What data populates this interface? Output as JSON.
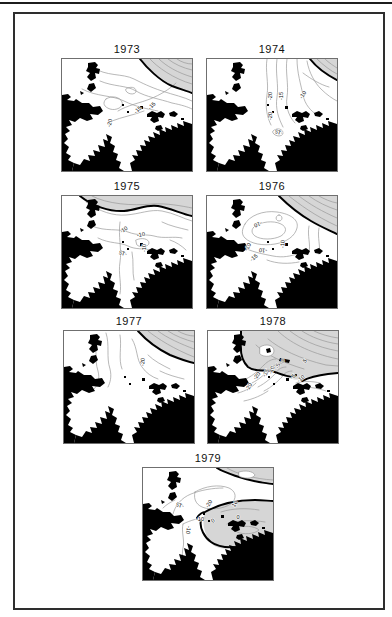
{
  "figure": {
    "colors": {
      "land": "#000000",
      "sea": "#ffffff",
      "shade": "#d6d6d6",
      "contour_thin": "#9a9a9a",
      "contour_thick": "#000000",
      "frame": "#2e2e2e"
    },
    "panels": [
      {
        "year": "1973",
        "contour_labels": [
          {
            "t": "-20",
            "x": 48,
            "y": 64,
            "r": -78
          },
          {
            "t": "-15",
            "x": 76,
            "y": 51,
            "r": -45
          },
          {
            "t": "-15",
            "x": 90,
            "y": 47,
            "r": -45
          }
        ]
      },
      {
        "year": "1974",
        "contour_labels": [
          {
            "t": "-20",
            "x": 64,
            "y": 37,
            "r": -90
          },
          {
            "t": "-15",
            "x": 75,
            "y": 37,
            "r": -90
          },
          {
            "t": "-20",
            "x": 64,
            "y": 57,
            "r": -90
          },
          {
            "t": "-15",
            "x": 72,
            "y": 73,
            "r": 200
          },
          {
            "t": "-10",
            "x": 96,
            "y": 36,
            "r": -55
          }
        ]
      },
      {
        "year": "1975",
        "contour_labels": [
          {
            "t": "-10",
            "x": 62,
            "y": 34,
            "r": -35
          },
          {
            "t": "-10",
            "x": 79,
            "y": 39,
            "r": -10
          },
          {
            "t": "-15",
            "x": 61,
            "y": 57,
            "r": 200
          },
          {
            "t": "-10",
            "x": 83,
            "y": 52,
            "r": -90
          }
        ]
      },
      {
        "year": "1976",
        "contour_labels": [
          {
            "t": "-10",
            "x": 51,
            "y": 28,
            "r": 160
          },
          {
            "t": "-10",
            "x": 41,
            "y": 51,
            "r": -60
          },
          {
            "t": "-10",
            "x": 56,
            "y": 54,
            "r": 185
          },
          {
            "t": "-10",
            "x": 76,
            "y": 48,
            "r": -85
          },
          {
            "t": "-15",
            "x": 47,
            "y": 62,
            "r": -40
          }
        ]
      },
      {
        "year": "1977",
        "contour_labels": [
          {
            "t": "-20",
            "x": 79,
            "y": 31,
            "r": -85
          }
        ]
      },
      {
        "year": "1978",
        "contour_labels": [
          {
            "t": "-20",
            "x": 49,
            "y": 45,
            "r": -50
          },
          {
            "t": "-15",
            "x": 58,
            "y": 42,
            "r": -60
          },
          {
            "t": "-10",
            "x": 64,
            "y": 39,
            "r": -70
          },
          {
            "t": "-5",
            "x": 70,
            "y": 35,
            "r": -70
          },
          {
            "t": "0",
            "x": 75,
            "y": 30,
            "r": -20
          },
          {
            "t": "5",
            "x": 97,
            "y": 30,
            "r": -45
          },
          {
            "t": "-5",
            "x": 85,
            "y": 46,
            "r": -40
          },
          {
            "t": "-10",
            "x": 93,
            "y": 48,
            "r": -40
          },
          {
            "t": "-20",
            "x": 41,
            "y": 56,
            "r": -60
          }
        ]
      },
      {
        "year": "1979",
        "contour_labels": [
          {
            "t": "-15",
            "x": 37,
            "y": 37,
            "r": 200
          },
          {
            "t": "-20",
            "x": 66,
            "y": 36,
            "r": -55
          },
          {
            "t": "10",
            "x": 92,
            "y": 36,
            "r": -55
          },
          {
            "t": "-10",
            "x": 57,
            "y": 52,
            "r": 0
          },
          {
            "t": "0",
            "x": 70,
            "y": 53,
            "r": -30
          },
          {
            "t": "0",
            "x": 95,
            "y": 50,
            "r": 0
          },
          {
            "t": "-10",
            "x": 45,
            "y": 62,
            "r": 100
          }
        ]
      }
    ]
  }
}
